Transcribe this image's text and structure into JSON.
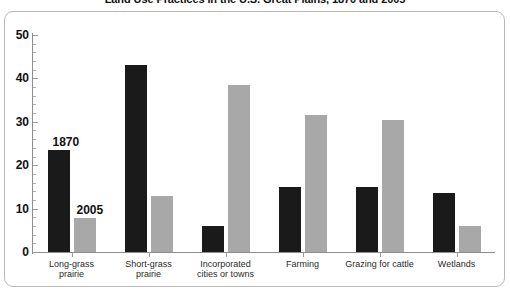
{
  "chart_data": {
    "type": "bar",
    "title": "Land Use Practices in the U.S. Great Plains, 1870 and 2005",
    "xlabel": "",
    "ylabel": "",
    "ylim": [
      0,
      50
    ],
    "ytick_labels": [
      "0",
      "10",
      "20",
      "30",
      "40",
      "50"
    ],
    "ytick_values": [
      0,
      10,
      20,
      30,
      40,
      50
    ],
    "minor_tick_step": 2,
    "grid": false,
    "legend_position": "in-plot-annotations",
    "categories": [
      "Long-grass\nprairie",
      "Short-grass\nprairie",
      "Incorporated\ncities or towns",
      "Farming",
      "Grazing for cattle",
      "Wetlands"
    ],
    "series": [
      {
        "name": "1870",
        "color": "#1a1a1a",
        "values": [
          23.5,
          43,
          6,
          15,
          15,
          13.5
        ]
      },
      {
        "name": "2005",
        "color": "#a8a8a8",
        "values": [
          7.8,
          12.8,
          38.5,
          31.5,
          30.5,
          6
        ]
      }
    ],
    "annotations": [
      {
        "text": "1870",
        "series": 0
      },
      {
        "text": "2005",
        "series": 1
      }
    ]
  },
  "colors": {
    "series_1870": "#1a1a1a",
    "series_2005": "#a8a8a8",
    "axis": "#8e8e8e",
    "frame_border": "#b9b9b9",
    "text": "#111111",
    "background": "#ffffff"
  }
}
